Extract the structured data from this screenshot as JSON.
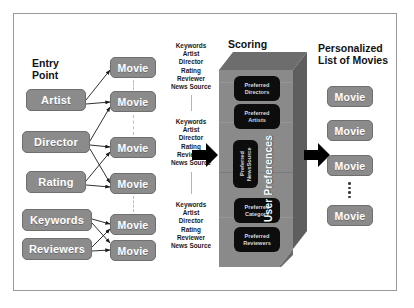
{
  "figure": {
    "background": "#ffffff",
    "node_color": "#8b8b8b",
    "pref_box_color": "#0d0d0d",
    "arrow_color": "#000000",
    "frame_color": "#9a9a9a"
  },
  "headers": {
    "entry_point": "Entry\nPoint",
    "scoring": "Scoring",
    "personalized": "Personalized\nList of Movies",
    "user_preferences": "User Preferences"
  },
  "entry_points": [
    {
      "label": "Artist"
    },
    {
      "label": "Director"
    },
    {
      "label": "Rating"
    },
    {
      "label": "Keywords"
    },
    {
      "label": "Reviewers"
    }
  ],
  "movies_column": [
    {
      "label": "Movie"
    },
    {
      "label": "Movie"
    },
    {
      "label": "Movie"
    },
    {
      "label": "Movie"
    },
    {
      "label": "Movie"
    },
    {
      "label": "Movie"
    }
  ],
  "attribute_lists": [
    {
      "items": [
        "Keywords",
        "Artist",
        "Director",
        "Rating",
        "Reviewer",
        "News Source"
      ]
    },
    {
      "items": [
        "Keywords",
        "Artist",
        "Director",
        "Rating",
        "Reviewer",
        "News Source"
      ]
    },
    {
      "items": [
        "Keywords",
        "Artist",
        "Director",
        "Rating",
        "Reviewer",
        "News Source"
      ]
    }
  ],
  "preferences": [
    {
      "label": "Preferred\nDirectors",
      "rotated": false
    },
    {
      "label": "Preferred\nArtists",
      "rotated": false
    },
    {
      "label": "Preferred\nNewsSource",
      "rotated": true
    },
    {
      "label": "Preferred\nCategory",
      "rotated": false
    },
    {
      "label": "Preferred\nReviewers",
      "rotated": false
    }
  ],
  "result_movies": [
    {
      "label": "Movie"
    },
    {
      "label": "Movie"
    },
    {
      "label": "Movie"
    },
    {
      "label": "Movie"
    }
  ],
  "ellipsis": "⋮"
}
